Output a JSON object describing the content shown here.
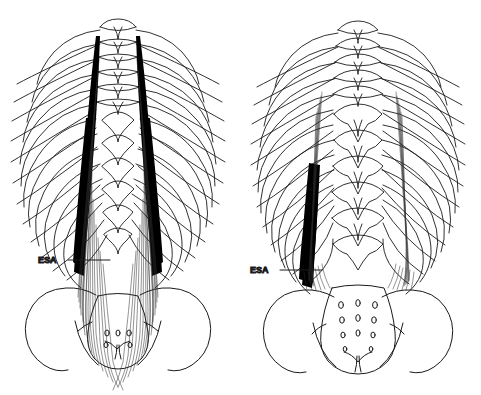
{
  "figure": {
    "background_color": "#ffffff",
    "line_color": "#1a1a1a",
    "fill_color": "#000000",
    "width": 481,
    "height": 395
  },
  "panels": [
    {
      "id": "left-panel",
      "name": "superficial-layer",
      "label": {
        "text": "ESA",
        "x": 38,
        "y": 263,
        "leader_x1": 68,
        "leader_x2": 110,
        "leader_y": 260
      },
      "center_x": 118,
      "ribs_per_side": 12,
      "muscle": "bilateral erector spinae with dense aponeurotic tendon"
    },
    {
      "id": "right-panel",
      "name": "deep-layer",
      "label": {
        "text": "ESA",
        "x": 250,
        "y": 273,
        "leader_x1": 280,
        "leader_x2": 322,
        "leader_y": 270
      },
      "center_x": 358,
      "ribs_per_side": 12,
      "muscle": "unilateral erector spinae tendon over vertebral column"
    }
  ],
  "anatomy": {
    "thoracic_vertebrae": 12,
    "lumbar_vertebrae": 5,
    "sacral_foramina_pairs": 4,
    "structures": [
      "rib-cage",
      "thoracic-vertebrae",
      "lumbar-vertebrae",
      "sacrum",
      "ilium",
      "erector-spinae-aponeurosis"
    ]
  }
}
